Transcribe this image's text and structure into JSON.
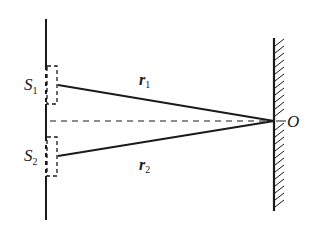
{
  "diagram": {
    "labels": {
      "s1": {
        "main": "S",
        "sub": "1"
      },
      "s2": {
        "main": "S",
        "sub": "2"
      },
      "r1": {
        "main": "r",
        "sub": "1"
      },
      "r2": {
        "main": "r",
        "sub": "2"
      },
      "o": "O"
    },
    "elements": [
      "barrier-with-slits",
      "slit-s1",
      "slit-s2",
      "path-r1",
      "path-r2",
      "center-axis-dashed",
      "screen-hatched",
      "point-o"
    ],
    "colors": {
      "line": "#1a1a1a",
      "background": "#ffffff"
    }
  }
}
